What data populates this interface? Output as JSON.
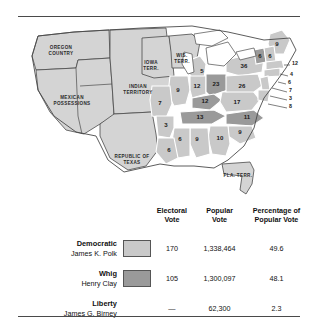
{
  "map": {
    "territory_labels": [
      {
        "name": "oregon-country",
        "lines": [
          "OREGON",
          "COUNTRY"
        ],
        "x": 47,
        "y": 25
      },
      {
        "name": "mexican-possessions",
        "lines": [
          "MEXICAN",
          "POSSESSIONS"
        ],
        "x": 58,
        "y": 75
      },
      {
        "name": "indian-territory",
        "lines": [
          "INDIAN",
          "TERRITORY"
        ],
        "x": 124,
        "y": 64
      },
      {
        "name": "iowa-territory",
        "lines": [
          "IOWA",
          "TERR."
        ],
        "x": 137,
        "y": 40
      },
      {
        "name": "wisconsin-territory",
        "lines": [
          "WIS.",
          "TERR."
        ],
        "x": 168,
        "y": 33
      },
      {
        "name": "republic-of-texas",
        "lines": [
          "REPUBLIC OF",
          "TEXAS"
        ],
        "x": 118,
        "y": 134
      },
      {
        "name": "florida-territory",
        "lines": [
          "FLA. TERR."
        ],
        "x": 224,
        "y": 153
      }
    ],
    "state_votes": [
      {
        "state": "maine",
        "value": "9",
        "x": 263,
        "y": 22
      },
      {
        "state": "vermont",
        "value": "6",
        "x": 246,
        "y": 34
      },
      {
        "state": "new-hampshire",
        "value": "6",
        "x": 256,
        "y": 34
      },
      {
        "state": "new-york",
        "value": "36",
        "x": 230,
        "y": 44
      },
      {
        "state": "pennsylvania",
        "value": "26",
        "x": 228,
        "y": 64
      },
      {
        "state": "michigan",
        "value": "5",
        "x": 188,
        "y": 49
      },
      {
        "state": "illinois",
        "value": "9",
        "x": 164,
        "y": 68
      },
      {
        "state": "indiana",
        "value": "12",
        "x": 183,
        "y": 64
      },
      {
        "state": "ohio",
        "value": "23",
        "x": 202,
        "y": 62
      },
      {
        "state": "missouri",
        "value": "7",
        "x": 146,
        "y": 81
      },
      {
        "state": "kentucky",
        "value": "12",
        "x": 191,
        "y": 79
      },
      {
        "state": "tennessee",
        "value": "13",
        "x": 186,
        "y": 95
      },
      {
        "state": "virginia",
        "value": "17",
        "x": 223,
        "y": 80
      },
      {
        "state": "north-carolina",
        "value": "11",
        "x": 233,
        "y": 95
      },
      {
        "state": "south-carolina",
        "value": "9",
        "x": 226,
        "y": 110
      },
      {
        "state": "georgia",
        "value": "10",
        "x": 206,
        "y": 116
      },
      {
        "state": "alabama",
        "value": "9",
        "x": 183,
        "y": 117
      },
      {
        "state": "mississippi",
        "value": "6",
        "x": 166,
        "y": 117
      },
      {
        "state": "arkansas",
        "value": "3",
        "x": 152,
        "y": 103
      },
      {
        "state": "louisiana",
        "value": "6",
        "x": 155,
        "y": 128
      }
    ],
    "leader_votes": [
      {
        "state": "massachusetts",
        "value": "12",
        "x": 278,
        "y": 41
      },
      {
        "state": "rhode-island",
        "value": "4",
        "x": 276,
        "y": 52
      },
      {
        "state": "connecticut",
        "value": "6",
        "x": 274,
        "y": 60
      },
      {
        "state": "new-jersey",
        "value": "7",
        "x": 275,
        "y": 68
      },
      {
        "state": "delaware",
        "value": "3",
        "x": 275,
        "y": 76
      },
      {
        "state": "maryland",
        "value": "8",
        "x": 275,
        "y": 84
      }
    ]
  },
  "table": {
    "headers": {
      "party": "",
      "swatch": "",
      "electoral": [
        "Electoral",
        "Vote"
      ],
      "popular": [
        "Popular",
        "Vote"
      ],
      "percentage": [
        "Percentage of",
        "Popular Vote"
      ]
    },
    "rows": [
      {
        "party": "Democratic",
        "candidate": "James K. Polk",
        "swatch_color": "#c9c9c9",
        "has_swatch": true,
        "electoral": "170",
        "popular": "1,338,464",
        "percentage": "49.6"
      },
      {
        "party": "Whig",
        "candidate": "Henry Clay",
        "swatch_color": "#9a9a9a",
        "has_swatch": true,
        "electoral": "105",
        "popular": "1,300,097",
        "percentage": "48.1"
      },
      {
        "party": "Liberty",
        "candidate": "James G. Birney",
        "swatch_color": "",
        "has_swatch": false,
        "electoral": "—",
        "popular": "62,300",
        "percentage": "2.3"
      }
    ]
  },
  "colors": {
    "democratic_fill": "#c9c9c9",
    "whig_fill": "#9a9a9a",
    "territory_fill": "#d4d4d4",
    "outline": "#4a4a4a"
  }
}
